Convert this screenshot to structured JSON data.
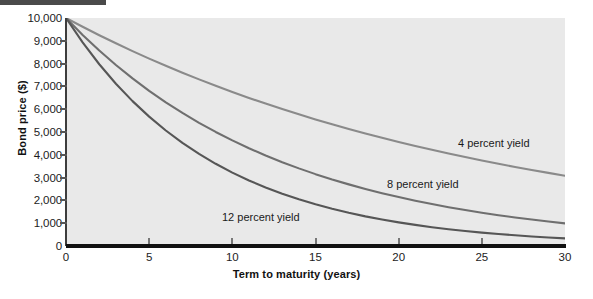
{
  "chart_data": {
    "type": "line",
    "title": "",
    "xlabel": "Term to maturity (years)",
    "ylabel": "Bond price ($)",
    "xlim": [
      0,
      30
    ],
    "ylim": [
      0,
      10000
    ],
    "xticks": [
      0,
      5,
      10,
      15,
      20,
      25,
      30
    ],
    "xtick_labels": [
      "0",
      "5",
      "10",
      "15",
      "20",
      "25",
      "30"
    ],
    "yticks": [
      0,
      1000,
      2000,
      3000,
      4000,
      5000,
      6000,
      7000,
      8000,
      9000,
      10000
    ],
    "ytick_labels": [
      "0",
      "1,000",
      "2,000",
      "3,000",
      "4,000",
      "5,000",
      "6,000",
      "7,000",
      "8,000",
      "9,000",
      "10,000"
    ],
    "grid": false,
    "legend_position": "inline-annotations",
    "face_color": "#e9e9e9",
    "series": [
      {
        "name": "4 percent yield",
        "annotation": "4 percent yield",
        "color": "#8a8a8a",
        "x": [
          0,
          1,
          2,
          3,
          4,
          5,
          6,
          7,
          8,
          9,
          10,
          11,
          12,
          13,
          14,
          15,
          16,
          17,
          18,
          19,
          20,
          21,
          22,
          23,
          24,
          25,
          26,
          27,
          28,
          29,
          30
        ],
        "values": [
          10000,
          9615,
          9246,
          8890,
          8548,
          8219,
          7903,
          7599,
          7307,
          7026,
          6756,
          6496,
          6246,
          6006,
          5775,
          5553,
          5339,
          5134,
          4936,
          4746,
          4564,
          4388,
          4220,
          4057,
          3901,
          3751,
          3607,
          3468,
          3335,
          3207,
          3083
        ]
      },
      {
        "name": "8 percent yield",
        "annotation": "8 percent yield",
        "color": "#6f6f6f",
        "x": [
          0,
          1,
          2,
          3,
          4,
          5,
          6,
          7,
          8,
          9,
          10,
          11,
          12,
          13,
          14,
          15,
          16,
          17,
          18,
          19,
          20,
          21,
          22,
          23,
          24,
          25,
          26,
          27,
          28,
          29,
          30
        ],
        "values": [
          10000,
          9259,
          8573,
          7938,
          7350,
          6806,
          6302,
          5835,
          5403,
          5002,
          4632,
          4289,
          3971,
          3677,
          3405,
          3152,
          2919,
          2703,
          2502,
          2317,
          2145,
          1987,
          1839,
          1703,
          1577,
          1460,
          1352,
          1252,
          1159,
          1073,
          994
        ]
      },
      {
        "name": "12 percent yield",
        "annotation": "12 percent yield",
        "color": "#565656",
        "x": [
          0,
          1,
          2,
          3,
          4,
          5,
          6,
          7,
          8,
          9,
          10,
          11,
          12,
          13,
          14,
          15,
          16,
          17,
          18,
          19,
          20,
          21,
          22,
          23,
          24,
          25,
          26,
          27,
          28,
          29,
          30
        ],
        "values": [
          10000,
          8929,
          7972,
          7118,
          6355,
          5674,
          5066,
          4523,
          4039,
          3606,
          3220,
          2875,
          2567,
          2292,
          2046,
          1827,
          1631,
          1456,
          1300,
          1161,
          1037,
          926,
          826,
          738,
          659,
          588,
          525,
          469,
          419,
          374,
          334
        ]
      }
    ]
  },
  "axes": {
    "y_title": "Bond price ($)",
    "x_title": "Term to maturity (years)"
  }
}
